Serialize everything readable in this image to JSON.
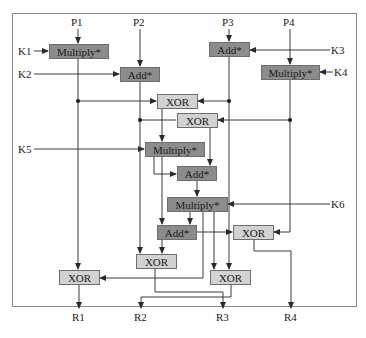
{
  "diagram": {
    "inputs": {
      "p1": "P1",
      "p2": "P2",
      "p3": "P3",
      "p4": "P4"
    },
    "keys": {
      "k1": "K1",
      "k2": "K2",
      "k3": "K3",
      "k4": "K4",
      "k5": "K5",
      "k6": "K6"
    },
    "outputs": {
      "r1": "R1",
      "r2": "R2",
      "r3": "R3",
      "r4": "R4"
    },
    "nodes": {
      "mul1": "Multiply*",
      "add1": "Add*",
      "add2": "Add*",
      "mul2": "Multiply*",
      "xor1": "XOR",
      "xor2": "XOR",
      "mul3": "Multiply*",
      "add3": "Add*",
      "mul4": "Multiply*",
      "add4": "Add*",
      "xor3": "XOR",
      "xor4": "XOR",
      "xor5": "XOR",
      "xor6": "XOR"
    },
    "colors": {
      "operation_box": "#8c8c8c",
      "xor_box": "#d2d2d2",
      "line": "#3a3a3a"
    }
  }
}
